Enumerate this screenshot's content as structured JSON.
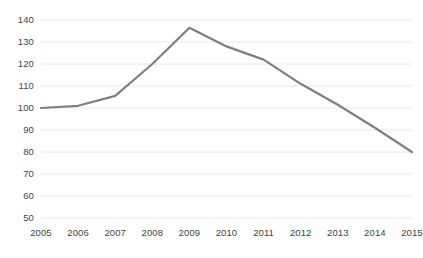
{
  "chart_data": {
    "type": "line",
    "title": "",
    "subtitle": "",
    "xlabel": "",
    "ylabel": "",
    "categories": [
      "2005",
      "2006",
      "2007",
      "2008",
      "2009",
      "2010",
      "2011",
      "2012",
      "2013",
      "2014",
      "2015"
    ],
    "values": [
      100,
      101,
      105.5,
      120,
      136.5,
      128,
      122,
      111,
      101.5,
      91,
      80
    ],
    "series": [
      {
        "name": "",
        "values": [
          100,
          101,
          105.5,
          120,
          136.5,
          128,
          122,
          111,
          101.5,
          91,
          80
        ],
        "color": "#7f7f7f"
      }
    ],
    "ylim": [
      50,
      140
    ],
    "y_ticks": [
      50,
      60,
      70,
      80,
      90,
      100,
      110,
      120,
      130,
      140
    ],
    "y_tick_labels": [
      "50",
      "60",
      "70",
      "80",
      "90",
      "100",
      "110",
      "120",
      "130",
      "140"
    ],
    "x_tick_labels": [
      "2005",
      "2006",
      "2007",
      "2008",
      "2009",
      "2010",
      "2011",
      "2012",
      "2013",
      "2014",
      "2015"
    ],
    "grid": {
      "horizontal": true,
      "vertical": false,
      "color": "#e8e8e8"
    },
    "legend": {
      "visible": false,
      "position": "none",
      "entries": []
    },
    "annotations": [],
    "line_color": "#7f7f7f",
    "line_width": 2.2,
    "markers": false,
    "background_color": "#ffffff",
    "axis_label_color": "#3f3f3f"
  }
}
